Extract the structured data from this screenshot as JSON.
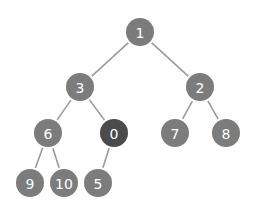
{
  "diagram": {
    "type": "binary-tree",
    "colors": {
      "node": "#7c7c7c",
      "highlight": "#4b4b4b",
      "edge": "#9a9a9a",
      "label": "#ffffff",
      "background": "#ffffff"
    },
    "node_radius": 14,
    "nodes": [
      {
        "id": "n1",
        "label": "1",
        "x": 140,
        "y": 32,
        "highlighted": false
      },
      {
        "id": "n3",
        "label": "3",
        "x": 80,
        "y": 87,
        "highlighted": false
      },
      {
        "id": "n2",
        "label": "2",
        "x": 200,
        "y": 87,
        "highlighted": false
      },
      {
        "id": "n6",
        "label": "6",
        "x": 48,
        "y": 133,
        "highlighted": false
      },
      {
        "id": "n0",
        "label": "0",
        "x": 114,
        "y": 133,
        "highlighted": true
      },
      {
        "id": "n7",
        "label": "7",
        "x": 175,
        "y": 133,
        "highlighted": false
      },
      {
        "id": "n8",
        "label": "8",
        "x": 226,
        "y": 133,
        "highlighted": false
      },
      {
        "id": "n9",
        "label": "9",
        "x": 30,
        "y": 183,
        "highlighted": false
      },
      {
        "id": "n10",
        "label": "10",
        "x": 64,
        "y": 183,
        "highlighted": false
      },
      {
        "id": "n5",
        "label": "5",
        "x": 98,
        "y": 183,
        "highlighted": false
      }
    ],
    "edges": [
      {
        "from": "n1",
        "to": "n3"
      },
      {
        "from": "n1",
        "to": "n2"
      },
      {
        "from": "n3",
        "to": "n6"
      },
      {
        "from": "n3",
        "to": "n0"
      },
      {
        "from": "n2",
        "to": "n7"
      },
      {
        "from": "n2",
        "to": "n8"
      },
      {
        "from": "n6",
        "to": "n9"
      },
      {
        "from": "n6",
        "to": "n10"
      },
      {
        "from": "n0",
        "to": "n5"
      }
    ]
  }
}
